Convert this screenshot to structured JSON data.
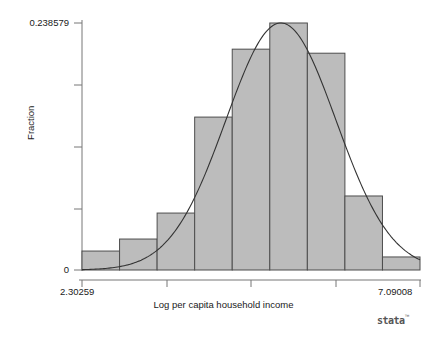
{
  "chart_data": {
    "type": "bar",
    "title": "",
    "subtitle": "",
    "xlabel": "Log per capita household income",
    "ylabel": "Fraction",
    "xlim": [
      2.30259,
      7.09008
    ],
    "ylim": [
      0,
      0.238579
    ],
    "xtick_labels": [
      "2.30259",
      "7.09008"
    ],
    "ytick_labels": [
      "0.238579",
      "0"
    ],
    "grid": false,
    "legend": null,
    "bin_edges": [
      2.30259,
      2.83456,
      3.36653,
      3.8985,
      4.43047,
      4.96244,
      5.49441,
      6.02638,
      6.55835,
      7.09008
    ],
    "categories": [
      "2.30259-2.83456",
      "2.83456-3.36653",
      "3.36653-3.89850",
      "3.89850-4.43047",
      "4.43047-4.96244",
      "4.96244-5.49441",
      "5.49441-6.02638",
      "6.02638-6.55835",
      "6.55835-7.09008"
    ],
    "values": [
      0.0183,
      0.0299,
      0.055,
      0.1477,
      0.2133,
      0.238579,
      0.2094,
      0.0715,
      0.0126
    ],
    "overlay": {
      "type": "line",
      "name": "normal density",
      "mean": 5.12,
      "sd": 0.78,
      "peak_value": 0.2386
    },
    "colors": {
      "bar_fill": "#bcbcbc",
      "bar_stroke": "#4d4d4d",
      "curve": "#333333",
      "axis": "#666666",
      "background": "#ffffff",
      "text": "#1a1a1a"
    }
  },
  "branding": {
    "logo_text": "stata",
    "logo_tm": "™"
  }
}
